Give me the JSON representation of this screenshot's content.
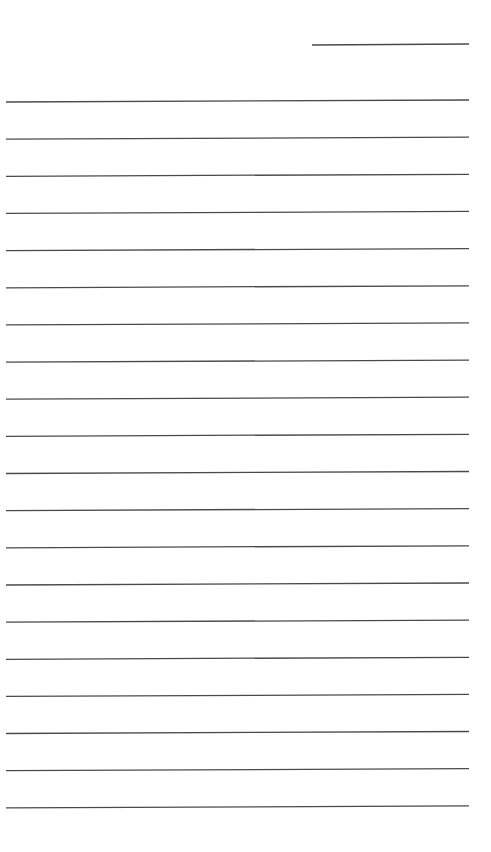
{
  "page": {
    "background": "#ffffff",
    "line_color": "#4a4a4a",
    "date_line": {
      "x1": 312,
      "y1": 45,
      "x2": 469,
      "y2": 44
    },
    "ruled_lines": {
      "count": 20,
      "x_start": 6,
      "x_end": 469,
      "first_y_left": 102,
      "first_y_right": 100,
      "spacing": 37.15
    }
  }
}
